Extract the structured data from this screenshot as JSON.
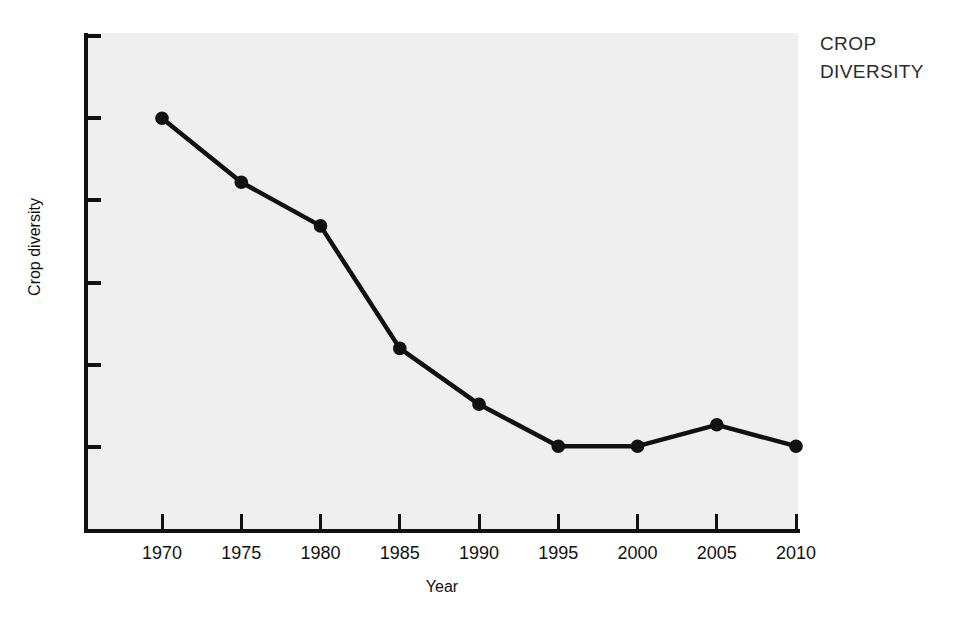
{
  "corner_title": "CROP\nDIVERSITY",
  "colors": {
    "line": "#111111",
    "marker": "#111111",
    "plot_background": "#efefef",
    "page_background": "#ffffff",
    "axis": "#111111",
    "title_text": "#2b2b2b"
  },
  "axis": {
    "x_title": "Year",
    "y_title": "Crop diversity"
  },
  "chart_data": {
    "type": "line",
    "title": "CROP DIVERSITY",
    "xlabel": "Year",
    "ylabel": "Crop diversity",
    "x": [
      1970,
      1975,
      1980,
      1985,
      1990,
      1995,
      2000,
      2005,
      2010
    ],
    "categories": [
      "1970",
      "1975",
      "1980",
      "1985",
      "1990",
      "1995",
      "2000",
      "2005",
      "2010"
    ],
    "values": [
      4.0,
      3.22,
      2.69,
      1.2,
      0.52,
      0.01,
      0.01,
      0.27,
      0.01
    ],
    "series": [
      {
        "name": "Crop diversity",
        "values": [
          4.0,
          3.22,
          2.69,
          1.2,
          0.52,
          0.01,
          0.01,
          0.27,
          0.01
        ]
      }
    ],
    "xlim": [
      1967.5,
      2012.5
    ],
    "ylim": [
      -1.0,
      5.0
    ],
    "y_tick_values": [
      0,
      1,
      2,
      3,
      4,
      5
    ],
    "y_tick_labels": [
      "",
      "",
      "",
      "",
      "",
      ""
    ],
    "x_tick_labels": [
      "1970",
      "1975",
      "1980",
      "1985",
      "1990",
      "1995",
      "2000",
      "2005",
      "2010"
    ],
    "grid": false,
    "legend": false,
    "marker": "filled-circle"
  }
}
